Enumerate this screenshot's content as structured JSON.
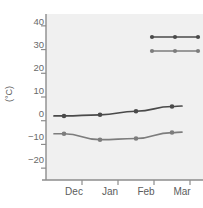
{
  "chart_data": {
    "type": "line",
    "title": "",
    "xlabel": "",
    "ylabel": "(°C)",
    "categories": [
      "Dec",
      "Jan",
      "Feb",
      "Mar"
    ],
    "ylim": [
      -25,
      45
    ],
    "yticks": [
      -20,
      -10,
      0,
      10,
      20,
      30,
      40
    ],
    "ytick_labels": [
      "−20",
      "−10",
      "0",
      "10",
      "20",
      "30",
      "40"
    ],
    "grid": false,
    "legend_position": "top-left",
    "legend_title": "Key",
    "series": [
      {
        "name": "Glasgow (Scotland)",
        "color": "#4a4a4a",
        "values": [
          2,
          2.5,
          4,
          6
        ]
      },
      {
        "name": "Moscow (Russia)",
        "color": "#7d7d7d",
        "values": [
          -5.5,
          -8,
          -7.5,
          -5
        ]
      }
    ]
  },
  "colors": {
    "plot_background": "#f0f0f0",
    "axis": "#8c8c8c",
    "tick_text": "#6a6a6a",
    "legend_text": "#3f3f3f",
    "legend_title": "#222222"
  }
}
